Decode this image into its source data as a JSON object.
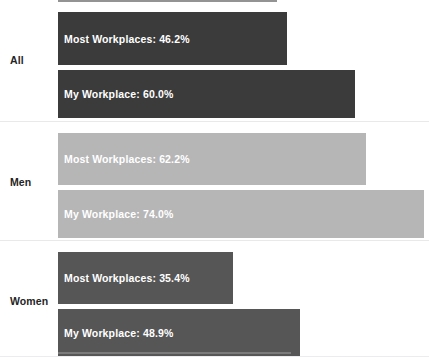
{
  "chart_data": {
    "type": "bar",
    "orientation": "horizontal",
    "title": "",
    "xlabel": "",
    "ylabel": "",
    "xlim": [
      0,
      80
    ],
    "grid": false,
    "legend": "none",
    "categories": [
      "All",
      "Men",
      "Women"
    ],
    "series": [
      {
        "name": "Most Workplaces",
        "values": [
          46.2,
          62.2,
          35.4
        ]
      },
      {
        "name": "My Workplace",
        "values": [
          60.0,
          74.0,
          48.9
        ]
      }
    ],
    "groups": [
      {
        "label": "All",
        "color": "#3b3b3b",
        "bars": [
          {
            "series": "Most Workplaces",
            "value": 46.2,
            "label": "Most Workplaces: 46.2%"
          },
          {
            "series": "My Workplace",
            "value": 60.0,
            "label": "My Workplace: 60.0%"
          }
        ]
      },
      {
        "label": "Men",
        "color": "#b6b6b7",
        "bars": [
          {
            "series": "Most Workplaces",
            "value": 62.2,
            "label": "Most Workplaces: 62.2%"
          },
          {
            "series": "My Workplace",
            "value": 74.0,
            "label": "My Workplace: 74.0%"
          }
        ]
      },
      {
        "label": "Women",
        "color": "#565656",
        "bars": [
          {
            "series": "Most Workplaces",
            "value": 35.4,
            "label": "Most Workplaces: 35.4%"
          },
          {
            "series": "My Workplace",
            "value": 48.9,
            "label": "My Workplace: 48.9%"
          }
        ]
      }
    ]
  },
  "colors": {
    "background": "#ffffff",
    "bar_dark": "#3b3b3b",
    "bar_light": "#b6b6b7",
    "bar_mid": "#565656",
    "bar_text": "#ffffff",
    "category_text": "#242424",
    "separator": "#e9e9ea"
  },
  "layout": {
    "plot_left_px": 58,
    "px_per_percent": 4.95
  }
}
